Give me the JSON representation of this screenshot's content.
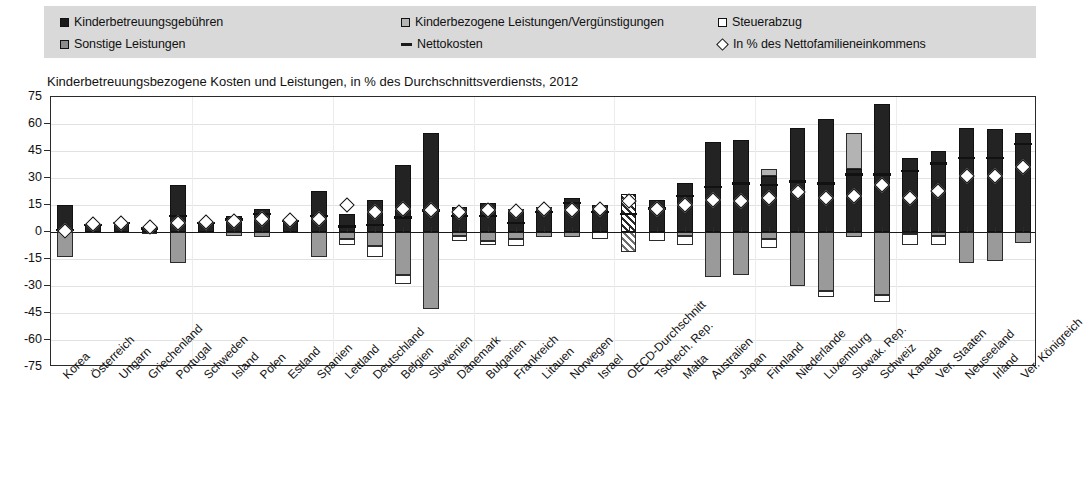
{
  "legend": {
    "items": [
      {
        "label": "Kinderbetreuungsgebühren",
        "marker": "square-black-icon",
        "col": 0,
        "row": 0
      },
      {
        "label": "Sonstige Leistungen",
        "marker": "square-midgray-icon",
        "col": 0,
        "row": 1
      },
      {
        "label": "Kinderbezogene Leistungen/Vergünstigungen",
        "marker": "square-lightgray-icon",
        "col": 1,
        "row": 0
      },
      {
        "label": "Nettokosten",
        "marker": "line-black-icon",
        "col": 1,
        "row": 1
      },
      {
        "label": "Steuerabzug",
        "marker": "square-white-icon",
        "col": 2,
        "row": 0
      },
      {
        "label": "In % des Nettofamilieneinkommens",
        "marker": "diamond-white-icon",
        "col": 2,
        "row": 1
      }
    ]
  },
  "chart_data": {
    "type": "bar",
    "title": "Kinderbetreuungsbezogene Kosten und Leistungen, in % des Durchschnittsverdiensts, 2012",
    "xlabel": "",
    "ylabel": "",
    "ylim": [
      -75,
      75
    ],
    "yticks": [
      75,
      60,
      45,
      30,
      15,
      0,
      -15,
      -30,
      -45,
      -60,
      -75
    ],
    "grid": true,
    "legend_position": "top",
    "stacked": true,
    "categories": [
      "Korea",
      "Österreich",
      "Ungarn",
      "Griechenland",
      "Portugal",
      "Schweden",
      "Island",
      "Polen",
      "Estland",
      "Spanien",
      "Lettland",
      "Deutschland",
      "Belgien",
      "Slowenien",
      "Dänemark",
      "Bulgarien",
      "Frankreich",
      "Litauen",
      "Norwegen",
      "Israel",
      "OECD-Durchschnitt",
      "Tschech. Rep.",
      "Malta",
      "Australien",
      "Japan",
      "Finnland",
      "Niederlande",
      "Luxemburg",
      "Slowak. Rep.",
      "Schweiz",
      "Kanada",
      "Ver. Staaten",
      "Neuseeland",
      "Irland",
      "Ver. Königreich"
    ],
    "series": [
      {
        "name": "Kinderbetreuungsgebühren",
        "key": "fee",
        "color": "#232323",
        "values": [
          15.0,
          4.0,
          5.0,
          3.0,
          26.0,
          5.0,
          9.0,
          13.0,
          6.0,
          23.0,
          10.0,
          18.0,
          37.0,
          55.0,
          14.0,
          16.0,
          13.0,
          14.0,
          19.0,
          15.0,
          21.0,
          18.0,
          27.0,
          50.0,
          51.0,
          31.0,
          58.0,
          63.0,
          35.0,
          71.0,
          41.0,
          45.0,
          58.0,
          57.0,
          55.0
        ]
      },
      {
        "name": "Kinderbezogene Leistungen/Vergünstigungen",
        "key": "benefits",
        "color": "#9a9a9a",
        "values": [
          -14.0,
          0.0,
          0.0,
          -1.0,
          -17.0,
          0.0,
          -2.0,
          -3.0,
          0.0,
          -14.0,
          -4.0,
          -8.0,
          -24.0,
          -43.0,
          -2.0,
          -5.0,
          -4.0,
          -3.0,
          -3.0,
          0.0,
          -11.0,
          0.0,
          -2.0,
          -25.0,
          -24.0,
          -4.0,
          -30.0,
          -33.0,
          -3.0,
          -35.0,
          -1.0,
          -2.0,
          -17.0,
          -16.0,
          -6.0
        ]
      },
      {
        "name": "Steuerabzug",
        "key": "tax",
        "color": "#ffffff",
        "values": [
          0.0,
          0.0,
          0.0,
          0.0,
          0.0,
          0.0,
          0.0,
          0.0,
          0.0,
          0.0,
          -3.0,
          -6.0,
          -5.0,
          0.0,
          -3.0,
          -2.0,
          -4.0,
          0.0,
          0.0,
          -4.0,
          0.0,
          -5.0,
          -5.0,
          0.0,
          0.0,
          -5.0,
          0.0,
          -3.0,
          0.0,
          -4.0,
          -6.0,
          -5.0,
          0.0,
          0.0,
          0.0
        ]
      },
      {
        "name": "Sonstige Leistungen",
        "key": "other",
        "color": "#b3b3b3",
        "values": [
          0.0,
          0.0,
          0.0,
          0.0,
          0.0,
          0.0,
          0.0,
          0.0,
          0.0,
          0.0,
          0.0,
          0.0,
          0.0,
          0.0,
          0.0,
          0.0,
          0.0,
          0.0,
          0.0,
          0.0,
          0.0,
          0.0,
          0.0,
          0.0,
          0.0,
          4.0,
          0.0,
          0.0,
          20.0,
          0.0,
          0.0,
          0.0,
          0.0,
          0.0,
          0.0
        ]
      }
    ],
    "nettokosten": [
      1.0,
      4.0,
      5.0,
      2.0,
      9.0,
      5.0,
      7.0,
      10.0,
      6.0,
      9.0,
      3.0,
      4.0,
      8.0,
      12.0,
      9.0,
      9.0,
      5.0,
      11.0,
      16.0,
      11.0,
      10.0,
      13.0,
      20.0,
      25.0,
      27.0,
      26.0,
      28.0,
      27.0,
      32.0,
      32.0,
      34.0,
      38.0,
      41.0,
      41.0,
      49.0
    ],
    "diamonds": {
      "name": "In % des Nettofamilieneinkommens",
      "values": [
        0.5,
        4.5,
        5.0,
        3.0,
        5.0,
        5.5,
        6.0,
        7.0,
        6.5,
        7.0,
        15.0,
        11.0,
        13.0,
        12.0,
        11.0,
        12.0,
        11.5,
        13.0,
        12.5,
        13.0,
        17.0,
        13.0,
        15.0,
        18.0,
        17.5,
        19.0,
        22.0,
        19.0,
        20.0,
        26.0,
        19.0,
        23.0,
        31.0,
        31.0,
        36.0
      ]
    },
    "highlight_category": "OECD-Durchschnitt"
  }
}
